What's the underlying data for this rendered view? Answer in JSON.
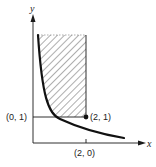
{
  "diagram": {
    "axes": {
      "x_label": "x",
      "y_label": "y"
    },
    "points": {
      "p01": "(0, 1)",
      "p21": "(2, 1)",
      "p20": "(2, 0)"
    },
    "elements": [
      "hatched region bounded by curve, x = 2 and y = 1",
      "decreasing curve approaching both axes",
      "horizontal line y = 1 from y-axis to (2, 1)",
      "vertical boundary x = 2",
      "filled dot at (2, 1)",
      "tick mark at x = 2"
    ],
    "colors": {
      "ink": "#1a1a1a",
      "background": "#ffffff"
    }
  }
}
